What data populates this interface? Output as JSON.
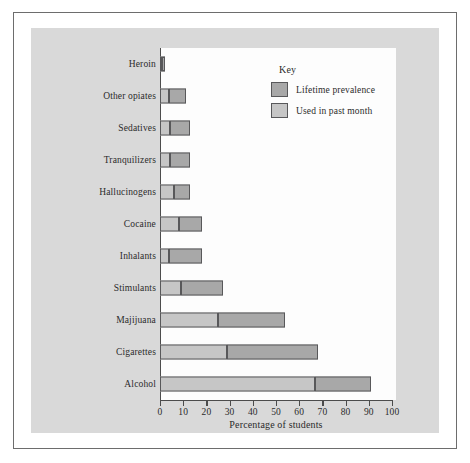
{
  "chart_data": {
    "type": "bar",
    "orientation": "horizontal",
    "stacked_overlay": true,
    "title": "",
    "xlabel": "Percentage of students",
    "ylabel": "",
    "xlim": [
      0,
      100
    ],
    "xticks": [
      0,
      10,
      20,
      30,
      40,
      50,
      60,
      70,
      80,
      90,
      100
    ],
    "grid": false,
    "legend_position": "upper-right-inside",
    "legend_title": "Key",
    "categories": [
      "Heroin",
      "Other opiates",
      "Sedatives",
      "Tranquilizers",
      "Hallucinogens",
      "Cocaine",
      "Inhalants",
      "Stimulants",
      "Majijuana",
      "Cigarettes",
      "Alcohol"
    ],
    "series": [
      {
        "name": "Lifetime prevalence",
        "color": "#a8a8a8",
        "values": [
          2,
          11,
          13,
          13,
          13,
          18,
          18,
          27,
          54,
          68,
          91
        ]
      },
      {
        "name": "Used in past month",
        "color": "#c6c6c6",
        "values": [
          1,
          4,
          4.5,
          4.5,
          6,
          8,
          4,
          9,
          25,
          29,
          67
        ]
      }
    ]
  },
  "axis": {
    "x_title": "Percentage of students",
    "tick_labels": [
      "0",
      "10",
      "20",
      "30",
      "40",
      "50",
      "60",
      "70",
      "80",
      "90",
      "100"
    ]
  },
  "legend": {
    "title": "Key",
    "items": [
      {
        "label": "Lifetime prevalence"
      },
      {
        "label": "Used in past month"
      }
    ]
  },
  "colors": {
    "lifetime": "#a8a8a8",
    "past_month": "#c6c6c6",
    "panel_background": "#d9d9d9",
    "plot_background": "#fdfdfd",
    "axis": "#4c4c4c",
    "frame": "#6d6d6d"
  }
}
